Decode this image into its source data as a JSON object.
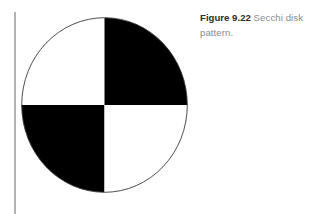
{
  "page": {
    "background_color": "#ffffff",
    "width": 313,
    "height": 214
  },
  "margin_rule": {
    "name": "left-margin-rule",
    "color": "#b2b2b6"
  },
  "figure": {
    "illustration_name": "secchi-disk-diagram",
    "shape": "circle",
    "outline_color": "#3a3a3a",
    "fill_white": "#ffffff",
    "fill_black": "#000000",
    "quadrants": [
      {
        "position": "top-left",
        "fill": "white"
      },
      {
        "position": "top-right",
        "fill": "black"
      },
      {
        "position": "bottom-left",
        "fill": "black"
      },
      {
        "position": "bottom-right",
        "fill": "white"
      }
    ]
  },
  "caption": {
    "label": "Figure 9.22",
    "text": " Secchi disk pattern.",
    "label_color": "#2b2b2e",
    "text_color": "#8a8a90"
  }
}
